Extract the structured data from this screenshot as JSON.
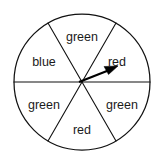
{
  "figure": {
    "name": "spinner-wheel",
    "geometry": {
      "center_x": 82,
      "center_y": 82,
      "radius": 68,
      "sector_count": 6,
      "sector_degrees": 60,
      "start_angle_deg": 0
    },
    "outline_color": "#111111",
    "background_color": "#ffffff",
    "label_color": "#1a1a1a"
  },
  "sectors": [
    {
      "id": "sector-right-red",
      "label": "red",
      "position": "upper-right",
      "start_angle_deg": 0,
      "end_angle_deg": 60,
      "label_x": 117,
      "label_y": 63
    },
    {
      "id": "sector-top-green",
      "label": "green",
      "position": "top",
      "start_angle_deg": 60,
      "end_angle_deg": 120,
      "label_x": 82,
      "label_y": 38
    },
    {
      "id": "sector-left-blue",
      "label": "blue",
      "position": "upper-left",
      "start_angle_deg": 120,
      "end_angle_deg": 180,
      "label_x": 44,
      "label_y": 63
    },
    {
      "id": "sector-lower-left-green",
      "label": "green",
      "position": "lower-left",
      "start_angle_deg": 180,
      "end_angle_deg": 240,
      "label_x": 44,
      "label_y": 106
    },
    {
      "id": "sector-bottom-red",
      "label": "red",
      "position": "bottom",
      "start_angle_deg": 240,
      "end_angle_deg": 300,
      "label_x": 82,
      "label_y": 131
    },
    {
      "id": "sector-lower-right-green",
      "label": "green",
      "position": "lower-right",
      "start_angle_deg": 300,
      "end_angle_deg": 360,
      "label_x": 122,
      "label_y": 106
    }
  ],
  "needle": {
    "id": "spinner-needle",
    "points_to_label": "red",
    "points_to_sector": "sector-right-red",
    "angle_deg": 22,
    "origin_x": 79,
    "origin_y": 82,
    "tip_x": 117,
    "tip_y": 67,
    "color": "#000000"
  },
  "spokes": [
    {
      "id": "spoke-horizontal",
      "angle_deg": 0
    },
    {
      "id": "spoke-upper-right",
      "angle_deg": 60
    },
    {
      "id": "spoke-upper-left",
      "angle_deg": 120
    }
  ]
}
